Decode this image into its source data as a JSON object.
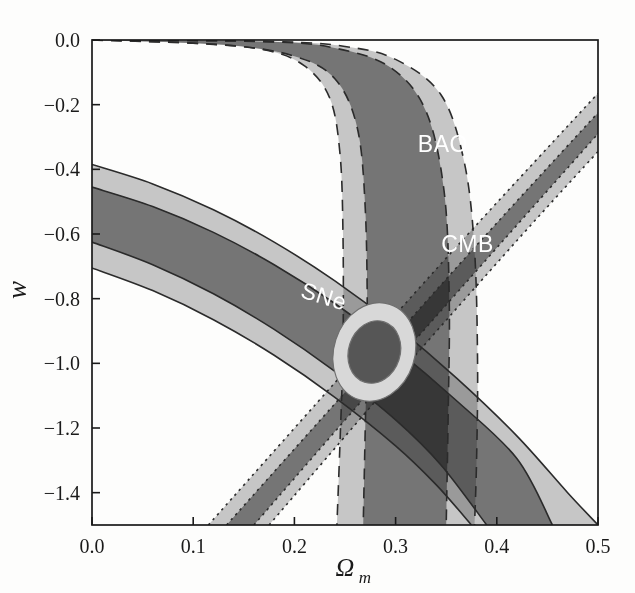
{
  "figure": {
    "kind": "cosmology-constraint-contour-plot",
    "background": "#fdfdfc",
    "title": ""
  },
  "axes": {
    "x": {
      "label": "Ω",
      "label_sub": "m",
      "min": 0.0,
      "max": 0.5,
      "ticks": [
        0.0,
        0.1,
        0.2,
        0.3,
        0.4,
        0.5
      ],
      "tick_labels": [
        "0.0",
        "0.1",
        "0.2",
        "0.3",
        "0.4",
        "0.5"
      ]
    },
    "y": {
      "label": "w",
      "min": -1.5,
      "max": 0.0,
      "ticks": [
        0.0,
        -0.2,
        -0.4,
        -0.6,
        -0.8,
        -1.0,
        -1.2,
        -1.4
      ],
      "tick_labels": [
        "0.0",
        "−0.2",
        "−0.4",
        "−0.6",
        "−0.8",
        "−1.0",
        "−1.2",
        "−1.4"
      ]
    }
  },
  "annotations": [
    {
      "name": "sne",
      "text": "SNe",
      "x": 0.205,
      "y": -0.795,
      "rotation": 17
    },
    {
      "name": "bao",
      "text": "BAO",
      "x": 0.322,
      "y": -0.345,
      "rotation": 0
    },
    {
      "name": "cmb",
      "text": "CMB",
      "x": 0.345,
      "y": -0.655,
      "rotation": 0
    }
  ],
  "colors": {
    "outer_2sigma": "#b6b6b6",
    "inner_1sigma": "#6e6e6e",
    "overlap_dark": "#4a4a4a",
    "combined_outer": "#d8d8d8",
    "combined_inner": "#565656",
    "axis": "#1a1a1a",
    "label_text": "#ffffff"
  },
  "chart_data": {
    "type": "contour",
    "title": "",
    "xlabel": "Ωm",
    "ylabel": "w",
    "xlim": [
      0.0,
      0.5
    ],
    "ylim": [
      -1.5,
      0.0
    ],
    "grid": false,
    "legend": "in-plot text labels",
    "series": [
      {
        "name": "SNe",
        "linestyle": "solid",
        "description": "Broad degenerate band sweeping from upper-left to lower-right",
        "contours": [
          {
            "level": "2sigma",
            "shade": "#b6b6b6",
            "upper_edge": [
              [
                0.0,
                -0.385
              ],
              [
                0.06,
                -0.445
              ],
              [
                0.12,
                -0.525
              ],
              [
                0.18,
                -0.625
              ],
              [
                0.24,
                -0.745
              ],
              [
                0.3,
                -0.885
              ],
              [
                0.36,
                -1.045
              ],
              [
                0.42,
                -1.225
              ],
              [
                0.47,
                -1.4
              ],
              [
                0.5,
                -1.5
              ]
            ],
            "lower_edge": [
              [
                0.0,
                -0.705
              ],
              [
                0.06,
                -0.775
              ],
              [
                0.12,
                -0.865
              ],
              [
                0.18,
                -0.975
              ],
              [
                0.24,
                -1.105
              ],
              [
                0.3,
                -1.255
              ],
              [
                0.34,
                -1.375
              ],
              [
                0.375,
                -1.5
              ]
            ]
          },
          {
            "level": "1sigma",
            "shade": "#6e6e6e",
            "upper_edge": [
              [
                0.0,
                -0.455
              ],
              [
                0.06,
                -0.515
              ],
              [
                0.12,
                -0.595
              ],
              [
                0.18,
                -0.695
              ],
              [
                0.24,
                -0.815
              ],
              [
                0.3,
                -0.955
              ],
              [
                0.36,
                -1.115
              ],
              [
                0.42,
                -1.295
              ],
              [
                0.455,
                -1.5
              ]
            ],
            "lower_edge": [
              [
                0.0,
                -0.625
              ],
              [
                0.06,
                -0.695
              ],
              [
                0.12,
                -0.785
              ],
              [
                0.18,
                -0.895
              ],
              [
                0.24,
                -1.025
              ],
              [
                0.3,
                -1.175
              ],
              [
                0.345,
                -1.315
              ],
              [
                0.39,
                -1.5
              ]
            ]
          }
        ]
      },
      {
        "name": "BAO",
        "linestyle": "dashed",
        "description": "Near-vertical band hugging w=0 at low Omega_m, bending down to a vertical wall near Omega_m=0.27-0.40",
        "contours": [
          {
            "level": "2sigma",
            "shade": "#b6b6b6",
            "left_edge": [
              [
                0.0,
                0.0
              ],
              [
                0.1,
                -0.01
              ],
              [
                0.17,
                -0.03
              ],
              [
                0.21,
                -0.08
              ],
              [
                0.235,
                -0.18
              ],
              [
                0.245,
                -0.35
              ],
              [
                0.248,
                -0.6
              ],
              [
                0.248,
                -0.95
              ],
              [
                0.245,
                -1.25
              ],
              [
                0.242,
                -1.5
              ]
            ],
            "right_edge": [
              [
                0.0,
                0.0
              ],
              [
                0.18,
                -0.005
              ],
              [
                0.25,
                -0.02
              ],
              [
                0.3,
                -0.06
              ],
              [
                0.345,
                -0.17
              ],
              [
                0.368,
                -0.38
              ],
              [
                0.378,
                -0.65
              ],
              [
                0.381,
                -1.0
              ],
              [
                0.38,
                -1.3
              ],
              [
                0.378,
                -1.5
              ]
            ]
          },
          {
            "level": "1sigma",
            "shade": "#6e6e6e",
            "left_edge": [
              [
                0.0,
                0.0
              ],
              [
                0.13,
                -0.015
              ],
              [
                0.2,
                -0.05
              ],
              [
                0.24,
                -0.12
              ],
              [
                0.262,
                -0.27
              ],
              [
                0.27,
                -0.52
              ],
              [
                0.272,
                -0.88
              ],
              [
                0.27,
                -1.2
              ],
              [
                0.268,
                -1.5
              ]
            ],
            "right_edge": [
              [
                0.0,
                0.0
              ],
              [
                0.17,
                -0.005
              ],
              [
                0.24,
                -0.025
              ],
              [
                0.295,
                -0.085
              ],
              [
                0.33,
                -0.22
              ],
              [
                0.348,
                -0.47
              ],
              [
                0.353,
                -0.8
              ],
              [
                0.352,
                -1.15
              ],
              [
                0.35,
                -1.5
              ]
            ]
          }
        ]
      },
      {
        "name": "CMB",
        "linestyle": "dotted",
        "description": "Straight diagonal band rising from lower-left to upper-right",
        "contours": [
          {
            "level": "2sigma",
            "shade": "#b6b6b6",
            "lower_edge": [
              [
                0.115,
                -1.5
              ],
              [
                0.24,
                -1.06
              ],
              [
                0.36,
                -0.64
              ],
              [
                0.5,
                -0.165
              ]
            ],
            "upper_edge": [
              [
                0.175,
                -1.5
              ],
              [
                0.3,
                -1.045
              ],
              [
                0.42,
                -0.62
              ],
              [
                0.5,
                -0.345
              ]
            ]
          },
          {
            "level": "1sigma",
            "shade": "#6e6e6e",
            "lower_edge": [
              [
                0.133,
                -1.5
              ],
              [
                0.26,
                -1.055
              ],
              [
                0.38,
                -0.635
              ],
              [
                0.5,
                -0.225
              ]
            ],
            "upper_edge": [
              [
                0.16,
                -1.5
              ],
              [
                0.285,
                -1.05
              ],
              [
                0.405,
                -0.625
              ],
              [
                0.5,
                -0.29
              ]
            ]
          }
        ]
      },
      {
        "name": "Combined",
        "linestyle": "solid",
        "description": "Small tilted joint-constraint ellipse at the mutual intersection",
        "center": [
          0.279,
          -0.965
        ],
        "contours": [
          {
            "level": "2sigma",
            "shade": "#d8d8d8",
            "semi_major": 0.155,
            "semi_minor": 0.04,
            "angle_deg": 72
          },
          {
            "level": "1sigma",
            "shade": "#565656",
            "semi_major": 0.098,
            "semi_minor": 0.0255,
            "angle_deg": 72
          }
        ]
      }
    ]
  }
}
